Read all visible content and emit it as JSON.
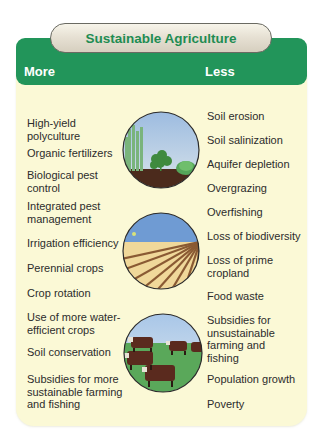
{
  "title": "Sustainable Agriculture",
  "columns": {
    "more": {
      "heading": "More",
      "items": [
        "High-yield\npolyculture",
        "Organic fertilizers",
        "Biological pest\ncontrol",
        "Integrated pest\nmanagement",
        "Irrigation efficiency",
        "Perennial crops",
        "Crop rotation",
        "Use of more water-\nefficient crops",
        "Soil conservation",
        "Subsidies for more\nsustainable farming\nand fishing"
      ]
    },
    "less": {
      "heading": "Less",
      "items": [
        "Soil erosion",
        "Soil salinization",
        "Aquifer depletion",
        "Overgrazing",
        "Overfishing",
        "Loss of biodiversity",
        "Loss of prime\ncropland",
        "Food waste",
        "Subsidies for\nunsustainable\nfarming and\nfishing",
        "Population growth",
        "Poverty"
      ]
    }
  },
  "illustrations": [
    {
      "name": "polyculture-plants-illustration",
      "description": "mixed crops growing in soil under blue sky"
    },
    {
      "name": "plowed-field-illustration",
      "description": "plowed furrows under blue sky with sun"
    },
    {
      "name": "grazing-cattle-illustration",
      "description": "brown cattle grazing on green pasture"
    }
  ],
  "colors": {
    "header_green": "#22955a",
    "panel_cream": "#fbf9d6",
    "title_text": "#1f8c52",
    "body_text": "#2c2c2c"
  }
}
